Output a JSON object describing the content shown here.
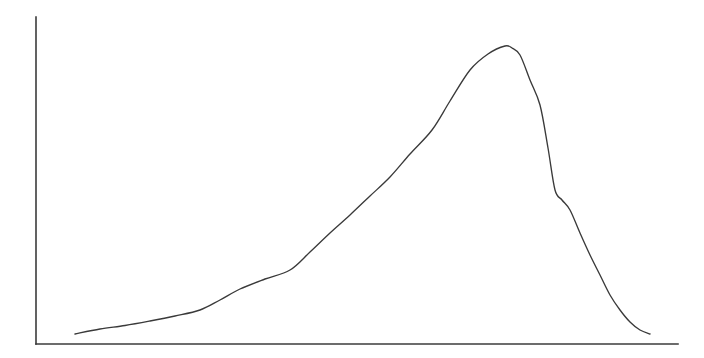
{
  "figure": {
    "title": "",
    "subtitle": "",
    "background_color": "#ffffff",
    "width": 704,
    "height": 358,
    "description": "Line plot of a single smooth unimodal left-skewed density curve rising slowly from the lower left, peaking near the right side, then falling steeply back to the baseline. No tick marks, no tick labels, no gridlines, no legend, no axis titles.",
    "curve_color": "#3a3a3a",
    "axis_color": "#3b3b3b",
    "curve_stroke_width": 1.35,
    "axis_stroke_width": 1.6
  },
  "axes": {
    "y_axis": {
      "name": "y-axis",
      "x": 36,
      "y_top": 17,
      "y_bottom": 344,
      "visible": true,
      "ticks": [],
      "tick_labels": [],
      "label": ""
    },
    "x_axis": {
      "name": "x-axis",
      "y": 344,
      "x_left": 36,
      "x_right": 678,
      "visible": true,
      "ticks": [],
      "tick_labels": [],
      "label": ""
    },
    "grid": false,
    "legend": false,
    "legend_position": "none"
  },
  "chart_data": {
    "type": "line",
    "title": "",
    "xlabel": "",
    "ylabel": "",
    "xlim": [
      36,
      678
    ],
    "ylim": [
      344,
      17
    ],
    "grid": false,
    "legend": false,
    "legend_position": "none",
    "axis_ticks": {
      "x": [],
      "y": []
    },
    "annotations": [],
    "series": [
      {
        "name": "density",
        "color": "#3a3a3a",
        "marker": "none",
        "linestyle": "solid",
        "x": [
          75,
          100,
          125,
          150,
          175,
          200,
          220,
          240,
          265,
          290,
          310,
          330,
          350,
          370,
          390,
          410,
          432,
          450,
          470,
          488,
          505,
          512,
          520,
          530,
          540,
          548,
          555,
          562,
          570,
          580,
          590,
          600,
          610,
          620,
          630,
          640,
          650
        ],
        "y": [
          334,
          329,
          325.5,
          321,
          316,
          310,
          300,
          289,
          279,
          270,
          252,
          233,
          215,
          196,
          177,
          154,
          130,
          101,
          70,
          54,
          46,
          48,
          55,
          80,
          105,
          148,
          190,
          200,
          210,
          233,
          255,
          275,
          295,
          310,
          322,
          330,
          334
        ]
      }
    ],
    "normalized_series": [
      {
        "name": "density (normalized 0-1, peak=1)",
        "x_fraction": [
          0.061,
          0.1,
          0.139,
          0.178,
          0.216,
          0.255,
          0.287,
          0.318,
          0.357,
          0.396,
          0.427,
          0.458,
          0.49,
          0.521,
          0.551,
          0.583,
          0.617,
          0.645,
          0.676,
          0.704,
          0.73,
          0.741,
          0.754,
          0.77,
          0.785,
          0.798,
          0.809,
          0.82,
          0.832,
          0.848,
          0.863,
          0.879,
          0.894,
          0.91,
          0.925,
          0.941,
          0.956
        ],
        "y_fraction": [
          0.0,
          0.017,
          0.029,
          0.044,
          0.061,
          0.081,
          0.115,
          0.152,
          0.186,
          0.216,
          0.278,
          0.343,
          0.405,
          0.47,
          0.535,
          0.613,
          0.695,
          0.795,
          0.901,
          0.955,
          1.0,
          0.993,
          0.969,
          0.882,
          0.795,
          0.646,
          0.5,
          0.466,
          0.431,
          0.351,
          0.274,
          0.205,
          0.135,
          0.083,
          0.042,
          0.014,
          0.0
        ]
      }
    ],
    "peak": {
      "x": 505,
      "y": 46,
      "x_fraction": 0.73,
      "label": ""
    },
    "shape": "unimodal, left-skewed (long tail toward low x), steep right flank"
  }
}
